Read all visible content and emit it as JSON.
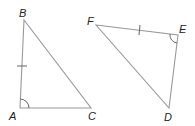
{
  "figure": {
    "triangles": [
      {
        "name": "ABC",
        "vertices": {
          "A": {
            "label": "A",
            "x": 20,
            "y": 108
          },
          "B": {
            "label": "B",
            "x": 24,
            "y": 20
          },
          "C": {
            "label": "C",
            "x": 91,
            "y": 108
          }
        },
        "congruent_side": "AB",
        "marked_angle": "A"
      },
      {
        "name": "FED",
        "vertices": {
          "F": {
            "label": "F",
            "x": 96,
            "y": 25
          },
          "E": {
            "label": "E",
            "x": 178,
            "y": 35
          },
          "D": {
            "label": "D",
            "x": 169,
            "y": 108
          }
        },
        "congruent_side": "FE",
        "marked_angle": "E"
      }
    ],
    "colors": {
      "line": "#999999",
      "label": "#222222"
    }
  }
}
